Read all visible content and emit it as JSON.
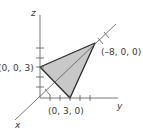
{
  "diagram": {
    "type": "3d-coordinate-plot",
    "axes": {
      "x_label": "x",
      "y_label": "y",
      "z_label": "z"
    },
    "triangle": {
      "fill": "#c8c8c8",
      "stroke": "#2a2a2a",
      "vertices": [
        {
          "label": "(0, 0, 3)",
          "coords": [
            0,
            0,
            3
          ]
        },
        {
          "label": "(–8, 0, 0)",
          "coords": [
            -8,
            0,
            0
          ]
        },
        {
          "label": "(0, 3, 0)",
          "coords": [
            0,
            3,
            0
          ]
        }
      ]
    }
  }
}
